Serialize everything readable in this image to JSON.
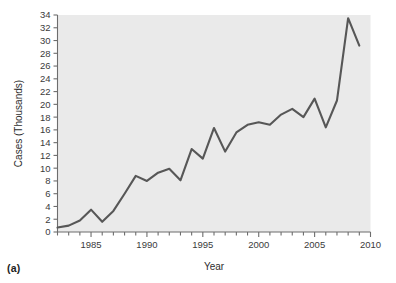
{
  "figure": {
    "panel_label": "(a)"
  },
  "chart_data": {
    "type": "line",
    "title": "",
    "xlabel": "Year",
    "ylabel": "Cases (Thousands)",
    "xlim": [
      1982,
      2010
    ],
    "ylim": [
      0,
      34
    ],
    "grid": false,
    "legend": null,
    "x_major_ticks": [
      1985,
      1990,
      1995,
      2000,
      2005,
      2010
    ],
    "x_minor_tick_step": 1,
    "y_ticks": [
      0,
      2,
      4,
      6,
      8,
      10,
      12,
      14,
      16,
      18,
      20,
      22,
      24,
      26,
      28,
      30,
      32,
      34
    ],
    "x": [
      1982,
      1983,
      1984,
      1985,
      1986,
      1987,
      1988,
      1989,
      1990,
      1991,
      1992,
      1993,
      1994,
      1995,
      1996,
      1997,
      1998,
      1999,
      2000,
      2001,
      2002,
      2003,
      2004,
      2005,
      2006,
      2007,
      2008,
      2009
    ],
    "series": [
      {
        "name": "Cases",
        "color": "#575757",
        "values": [
          0.7,
          1.0,
          1.8,
          3.5,
          1.6,
          3.3,
          6.0,
          8.8,
          8.0,
          9.3,
          9.9,
          8.1,
          13.0,
          11.5,
          16.3,
          12.6,
          15.6,
          16.8,
          17.2,
          16.8,
          18.4,
          19.3,
          18.0,
          20.9,
          16.4,
          20.6,
          33.5,
          29.2
        ]
      }
    ]
  }
}
